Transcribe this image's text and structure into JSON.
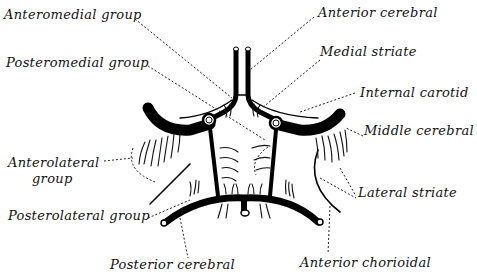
{
  "figure": {
    "labels": {
      "anteromedial_group": "Anteromedial group",
      "posteromedial_group": "Posteromedial group",
      "anterolateral_group_line1": "Anterolateral",
      "anterolateral_group_line2": "group",
      "posterolateral_group": "Posterolateral group",
      "posterior_cerebral": "Posterior cerebral",
      "anterior_cerebral": "Anterior cerebral",
      "medial_striate": "Medial striate",
      "internal_carotid": "Internal carotid",
      "middle_cerebral": "Middle cerebral",
      "lateral_striate": "Lateral striate",
      "anterior_chorioidal": "Anterior chorioidal"
    },
    "colors": {
      "ink": "#000000",
      "background": "#ffffff"
    }
  }
}
